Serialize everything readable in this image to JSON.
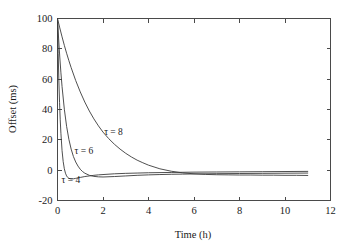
{
  "chart_data": {
    "type": "line",
    "title": "",
    "subtitle": "",
    "xlabel": "Time (h)",
    "ylabel": "Offset (ms)",
    "xlim": [
      0,
      12
    ],
    "ylim": [
      -20,
      100
    ],
    "xticks": [
      0,
      2,
      4,
      6,
      8,
      10,
      12
    ],
    "xtick_labels": [
      "0",
      "2",
      "4",
      "6",
      "8",
      "10",
      "12"
    ],
    "yticks": [
      -20,
      0,
      20,
      40,
      60,
      80,
      100
    ],
    "ytick_labels": [
      "-20",
      "0",
      "20",
      "40",
      "60",
      "80",
      "100"
    ],
    "grid": false,
    "legend_position": "inline-annotations",
    "annotations": [
      {
        "text": "τ = 8",
        "x": 2.05,
        "y": 23.5
      },
      {
        "text": "τ = 6",
        "x": 0.75,
        "y": 10.5
      },
      {
        "text": "τ = 4",
        "x": 0.18,
        "y": -8.5
      }
    ],
    "series": [
      {
        "name": "τ = 8",
        "label": "τ = 8",
        "color": "#3b3b3b",
        "x": [
          0,
          0.1,
          0.2,
          0.3,
          0.4,
          0.5,
          0.6,
          0.8,
          1.0,
          1.2,
          1.4,
          1.6,
          1.8,
          2.0,
          2.25,
          2.5,
          2.75,
          3.0,
          3.25,
          3.5,
          3.75,
          4.0,
          4.5,
          5.0,
          5.5,
          6.0,
          6.5,
          7.0,
          7.5,
          8.0,
          8.5,
          9.0,
          9.5,
          10.0,
          10.5,
          11.0
        ],
        "y": [
          100,
          93.8,
          87.9,
          82.3,
          77.1,
          72.2,
          67.6,
          59.1,
          51.6,
          44.9,
          39.0,
          33.8,
          29.2,
          25.1,
          20.8,
          17.1,
          13.9,
          11.1,
          8.7,
          6.6,
          4.9,
          3.3,
          0.9,
          -0.7,
          -1.8,
          -2.4,
          -2.8,
          -3.0,
          -3.1,
          -3.2,
          -3.2,
          -3.3,
          -3.3,
          -3.4,
          -3.4,
          -3.5
        ]
      },
      {
        "name": "τ = 6",
        "label": "τ = 6",
        "color": "#3b3b3b",
        "x": [
          0,
          0.05,
          0.1,
          0.15,
          0.2,
          0.3,
          0.4,
          0.5,
          0.6,
          0.7,
          0.8,
          0.9,
          1.0,
          1.1,
          1.2,
          1.4,
          1.6,
          1.8,
          2.0,
          2.5,
          3.0,
          3.5,
          4.0,
          4.5,
          5.0,
          5.5,
          6.0,
          7.0,
          8.0,
          9.0,
          10.0,
          11.0
        ],
        "y": [
          100,
          86.5,
          74.6,
          64.2,
          55.1,
          40.2,
          28.9,
          20.3,
          13.9,
          9.0,
          5.4,
          2.7,
          0.6,
          -0.9,
          -2.0,
          -3.4,
          -4.1,
          -4.4,
          -4.5,
          -4.2,
          -3.8,
          -3.4,
          -3.1,
          -2.9,
          -2.7,
          -2.6,
          -2.5,
          -2.3,
          -2.2,
          -2.1,
          -2.0,
          -1.9
        ]
      },
      {
        "name": "τ = 4",
        "label": "τ = 4",
        "color": "#3b3b3b",
        "x": [
          0,
          0.03,
          0.06,
          0.09,
          0.12,
          0.15,
          0.2,
          0.25,
          0.3,
          0.35,
          0.4,
          0.45,
          0.5,
          0.6,
          0.7,
          0.8,
          0.9,
          1.0,
          1.2,
          1.4,
          1.6,
          1.8,
          2.0,
          2.5,
          3.0,
          3.5,
          4.0,
          5.0,
          6.0,
          7.0,
          8.0,
          9.0,
          10.0,
          11.0
        ],
        "y": [
          100,
          77.0,
          58.8,
          44.5,
          33.2,
          24.3,
          12.9,
          5.6,
          0.9,
          -2.0,
          -3.8,
          -4.8,
          -5.4,
          -5.8,
          -5.7,
          -5.4,
          -5.1,
          -4.8,
          -4.2,
          -3.8,
          -3.4,
          -3.1,
          -2.9,
          -2.4,
          -2.1,
          -1.9,
          -1.7,
          -1.5,
          -1.3,
          -1.2,
          -1.1,
          -1.0,
          -0.9,
          -0.8
        ]
      }
    ]
  },
  "axes": {
    "x_title": "Time (h)",
    "y_title": "Offset (ms)"
  }
}
